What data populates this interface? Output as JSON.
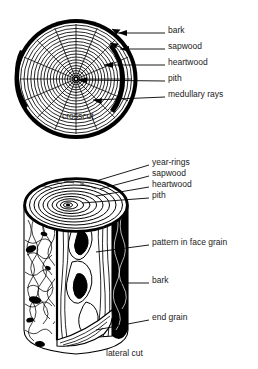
{
  "figure": {
    "background_color": "#ffffff",
    "ink_color": "#000000",
    "text_color": "#1a1a1a"
  },
  "crosscut": {
    "caption": "crosscut",
    "labels": [
      {
        "key": "bark",
        "text": "bark",
        "text_x": 168,
        "text_y": 29,
        "leader_x1": 141,
        "leader_x2": 165,
        "leader_y": 33,
        "arrow": true,
        "arrow_x": 112,
        "arrow_y": 29
      },
      {
        "key": "sapwood",
        "text": "sapwood",
        "text_x": 168,
        "text_y": 45,
        "leader_x1": 141,
        "leader_x2": 165,
        "leader_y": 49,
        "arrow": true,
        "arrow_x": 110,
        "arrow_y": 43
      },
      {
        "key": "heartwood",
        "text": "heartwood",
        "text_x": 168,
        "text_y": 61,
        "leader_x1": 141,
        "leader_x2": 165,
        "leader_y": 65,
        "arrow": true,
        "arrow_x": 105,
        "arrow_y": 63
      },
      {
        "key": "pith",
        "text": "pith",
        "text_x": 168,
        "text_y": 77,
        "leader_x1": 141,
        "leader_x2": 165,
        "leader_y": 81,
        "arrow": true,
        "arrow_x": 73,
        "arrow_y": 82
      },
      {
        "key": "medullary-rays",
        "text": "medullary rays",
        "text_x": 168,
        "text_y": 93,
        "leader_x1": 141,
        "leader_x2": 165,
        "leader_y": 97,
        "arrow": true,
        "arrow_x": 94,
        "arrow_y": 100
      }
    ],
    "caption_x": 62,
    "caption_y": 115,
    "ring_count": 17,
    "ray_count": 16
  },
  "lateral": {
    "caption": "lateral cut",
    "labels": [
      {
        "key": "year-rings",
        "text": "year-rings",
        "text_x": 152,
        "text_y": 161,
        "leader_x1": 124,
        "leader_x2": 149,
        "leader_y": 165
      },
      {
        "key": "sapwood",
        "text": "sapwood",
        "text_x": 152,
        "text_y": 172,
        "leader_x1": 124,
        "leader_x2": 149,
        "leader_y": 176
      },
      {
        "key": "heartwood",
        "text": "heartwood",
        "text_x": 152,
        "text_y": 183,
        "leader_x1": 124,
        "leader_x2": 149,
        "leader_y": 187
      },
      {
        "key": "pith",
        "text": "pith",
        "text_x": 152,
        "text_y": 194,
        "leader_x1": 124,
        "leader_x2": 149,
        "leader_y": 198
      },
      {
        "key": "pattern-in-face-grain",
        "text": "pattern in face grain",
        "text_x": 152,
        "text_y": 241,
        "leader_x1": 124,
        "leader_x2": 149,
        "leader_y": 245
      },
      {
        "key": "bark",
        "text": "bark",
        "text_x": 152,
        "text_y": 279,
        "leader_x1": 124,
        "leader_x2": 149,
        "leader_y": 283
      },
      {
        "key": "end-grain",
        "text": "end grain",
        "text_x": 152,
        "text_y": 316,
        "leader_x1": 124,
        "leader_x2": 149,
        "leader_y": 320
      }
    ],
    "caption_x": 106,
    "caption_y": 352,
    "ring_count": 9
  }
}
